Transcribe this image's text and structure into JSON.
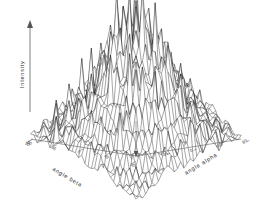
{
  "figure": {
    "name": "3d-wireframe-surface-plot",
    "background_color": "#ffffff",
    "line_color": "#1a1a1a",
    "axis_color": "#555555"
  },
  "axes": {
    "vertical": {
      "label": "Intensity",
      "icon": "arrow-up-icon"
    },
    "left": {
      "label": "angle beta",
      "ticks": [
        "90",
        "45",
        "0",
        "45"
      ]
    },
    "right": {
      "label": "angle alpha",
      "ticks": [
        "90",
        "45",
        "0",
        "45"
      ]
    },
    "corner_ticks": [
      "90",
      "90"
    ]
  },
  "chart_data": {
    "type": "surface",
    "title": "",
    "xlabel": "angle alpha",
    "ylabel": "angle beta",
    "zlabel": "Intensity",
    "xlim": [
      -90,
      90
    ],
    "ylim": [
      -90,
      90
    ],
    "zlim": [
      0,
      1
    ],
    "grid": true,
    "legend": false,
    "legend_position": "none",
    "x_ticks": [
      -90,
      -45,
      0,
      45,
      90
    ],
    "y_ticks": [
      -90,
      -45,
      0,
      45,
      90
    ],
    "grid_size": [
      34,
      34
    ],
    "peak_center": [
      0,
      0
    ],
    "peak_height": 1.0,
    "envelope_sigma": 46,
    "spike_amplitude": 0.62,
    "ripple_amplitude": 0.14,
    "ripple_period": 14,
    "noise_amplitude": 0.07
  }
}
